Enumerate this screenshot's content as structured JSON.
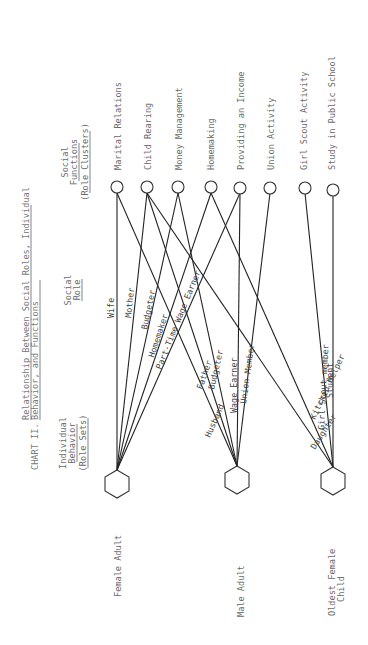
{
  "title": {
    "chart_number": "CHART II.",
    "line1": "Relationship Between Social Roles, Individual",
    "line2": "Behavior, and Functions"
  },
  "headers": {
    "individual_behavior": [
      "Individual",
      "Behavior",
      "(Role Sets)"
    ],
    "social_role": [
      "Social",
      "Role"
    ],
    "social_functions": [
      "Social",
      "Functions",
      "(Role Clusters)"
    ]
  },
  "actors": [
    {
      "id": "female",
      "label": [
        "Female Adult"
      ]
    },
    {
      "id": "male",
      "label": [
        "Male Adult"
      ]
    },
    {
      "id": "child",
      "label": [
        "Oldest Female",
        "Child"
      ]
    }
  ],
  "functions": [
    "Marital Relations",
    "Child Rearing",
    "Money Management",
    "Homemaking",
    "Providing an Income",
    "Union Activity",
    "Girl Scout Activity",
    "Study in Public School"
  ],
  "roles": [
    {
      "actor": "female",
      "label": "Wife",
      "function": "Marital Relations"
    },
    {
      "actor": "female",
      "label": "Mother",
      "function": "Child Rearing"
    },
    {
      "actor": "female",
      "label": "Budgeter",
      "function": "Money Management"
    },
    {
      "actor": "female",
      "label": "Homemaker",
      "function": "Homemaking"
    },
    {
      "actor": "female",
      "label": "Part-Time Wage Earner",
      "function": "Providing an Income"
    },
    {
      "actor": "male",
      "label": "Husband",
      "function": "Marital Relations"
    },
    {
      "actor": "male",
      "label": "Father",
      "function": "Child Rearing"
    },
    {
      "actor": "male",
      "label": "Budgeter",
      "function": "Money Management"
    },
    {
      "actor": "male",
      "label": "Wage Earner",
      "function": "Providing an Income"
    },
    {
      "actor": "male",
      "label": "Union Member",
      "function": "Union Activity"
    },
    {
      "actor": "child",
      "label": "Daughter",
      "function": "Child Rearing"
    },
    {
      "actor": "child",
      "label": "Kitchen Helper",
      "function": "Homemaking"
    },
    {
      "actor": "child",
      "label": "Girl Scout member",
      "function": "Girl Scout Activity"
    },
    {
      "actor": "child",
      "label": "Student",
      "function": "Study in Public School"
    }
  ]
}
